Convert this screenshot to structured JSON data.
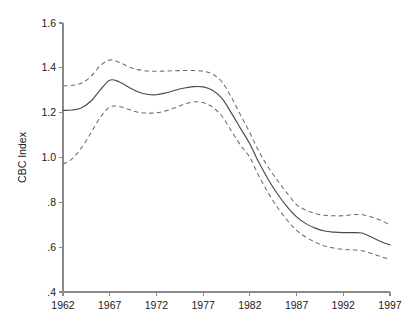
{
  "chart_data": {
    "type": "line",
    "title": "",
    "subtitle": "",
    "xlabel": "",
    "ylabel": "CBC Index",
    "xlim": [
      1962,
      1997
    ],
    "ylim": [
      0.4,
      1.6
    ],
    "grid": false,
    "legend": "none",
    "x_ticks": [
      "1962",
      "1967",
      "1972",
      "1977",
      "1982",
      "1987",
      "1992",
      "1997"
    ],
    "x_tick_values": [
      1962,
      1967,
      1972,
      1977,
      1982,
      1987,
      1992,
      1997
    ],
    "y_ticks": [
      "1.6",
      "1.4",
      "1.2",
      "1.0",
      ".8",
      ".6",
      ".4"
    ],
    "y_tick_values": [
      1.6,
      1.4,
      1.2,
      1.0,
      0.8,
      0.6,
      0.4
    ],
    "x": [
      1962,
      1963,
      1964,
      1965,
      1966,
      1967,
      1968,
      1969,
      1970,
      1971,
      1972,
      1973,
      1974,
      1975,
      1976,
      1977,
      1978,
      1979,
      1980,
      1981,
      1982,
      1983,
      1984,
      1985,
      1986,
      1987,
      1988,
      1989,
      1990,
      1991,
      1992,
      1993,
      1994,
      1995,
      1996,
      1997
    ],
    "series": [
      {
        "name": "CBC Index estimate",
        "style": "solid",
        "values": [
          1.21,
          1.212,
          1.222,
          1.252,
          1.302,
          1.345,
          1.338,
          1.315,
          1.293,
          1.282,
          1.28,
          1.288,
          1.3,
          1.31,
          1.316,
          1.315,
          1.3,
          1.265,
          1.2,
          1.13,
          1.06,
          0.975,
          0.9,
          0.835,
          0.78,
          0.735,
          0.705,
          0.685,
          0.672,
          0.667,
          0.665,
          0.665,
          0.663,
          0.645,
          0.625,
          0.61
        ]
      },
      {
        "name": "Upper confidence bound",
        "style": "dashed",
        "values": [
          1.32,
          1.322,
          1.332,
          1.362,
          1.41,
          1.435,
          1.425,
          1.405,
          1.392,
          1.386,
          1.385,
          1.386,
          1.387,
          1.388,
          1.388,
          1.385,
          1.372,
          1.338,
          1.27,
          1.19,
          1.11,
          1.025,
          0.955,
          0.895,
          0.84,
          0.79,
          0.765,
          0.75,
          0.742,
          0.74,
          0.74,
          0.745,
          0.745,
          0.735,
          0.72,
          0.7
        ]
      },
      {
        "name": "Lower confidence bound",
        "style": "dashed",
        "values": [
          0.97,
          0.995,
          1.045,
          1.11,
          1.18,
          1.225,
          1.228,
          1.215,
          1.202,
          1.198,
          1.2,
          1.208,
          1.222,
          1.238,
          1.248,
          1.245,
          1.225,
          1.185,
          1.12,
          1.055,
          1.0,
          0.915,
          0.84,
          0.775,
          0.72,
          0.675,
          0.645,
          0.622,
          0.605,
          0.596,
          0.59,
          0.588,
          0.584,
          0.572,
          0.558,
          0.545
        ]
      }
    ]
  }
}
